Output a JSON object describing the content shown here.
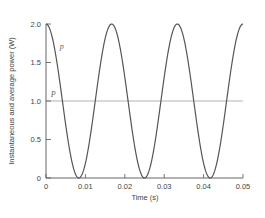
{
  "chart_data": {
    "type": "line",
    "title": "",
    "xlabel": "Time (s)",
    "ylabel": "Instantaneous and average power (W)",
    "xlim": [
      0,
      0.05
    ],
    "ylim": [
      0,
      2.0
    ],
    "grid": false,
    "x_ticks": [
      "0",
      "0.01",
      "0.02",
      "0.03",
      "0.04",
      "0.05"
    ],
    "x_tick_values": [
      0,
      0.01,
      0.02,
      0.03,
      0.04,
      0.05
    ],
    "y_ticks": [
      "0",
      "0.5",
      "1.0",
      "1.5",
      "2.0"
    ],
    "y_tick_values": [
      0,
      0.5,
      1.0,
      1.5,
      2.0
    ],
    "series": [
      {
        "name": "p",
        "description": "instantaneous power",
        "function": "1 + cos(2*pi*60*t)",
        "x": [
          0,
          0.00417,
          0.00833,
          0.0125,
          0.01667,
          0.02083,
          0.025,
          0.02917,
          0.03333,
          0.0375,
          0.04167,
          0.04583,
          0.05
        ],
        "values": [
          2.0,
          1.0,
          0.0,
          1.0,
          2.0,
          1.0,
          0.0,
          1.0,
          2.0,
          1.0,
          0.0,
          1.0,
          2.0
        ],
        "color": "#555555"
      },
      {
        "name": "P",
        "description": "average power",
        "x": [
          0,
          0.05
        ],
        "values": [
          1.0,
          1.0
        ],
        "color": "#aaaaaa"
      }
    ],
    "annotations": [
      {
        "text": "p",
        "x": 0.0035,
        "y": 1.68
      },
      {
        "text": "P",
        "x": 0.0012,
        "y": 1.05
      }
    ]
  }
}
